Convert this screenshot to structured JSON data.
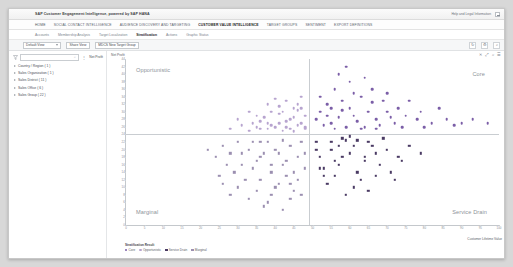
{
  "window": {
    "title": "SAP Customer Engagement Intelligence, powered by SAP HANA",
    "user_label": "Help and Legal Information",
    "logout_icon": "logout-icon"
  },
  "primary_nav": [
    {
      "label": "HOME",
      "active": false
    },
    {
      "label": "SOCIAL CONTACT INTELLIGENCE",
      "active": false
    },
    {
      "label": "AUDIENCE DISCOVERY AND TARGETING",
      "active": false
    },
    {
      "label": "CUSTOMER VALUE INTELLIGENCE",
      "active": true
    },
    {
      "label": "TARGET GROUPS",
      "active": false
    },
    {
      "label": "SENTIMENT",
      "active": false
    },
    {
      "label": "EXPORT DEFINITIONS",
      "active": false
    }
  ],
  "secondary_nav": [
    {
      "label": "Accounts",
      "active": false
    },
    {
      "label": "Membership Analysis",
      "active": false
    },
    {
      "label": "Target Localization",
      "active": false
    },
    {
      "label": "Stratification",
      "active": true
    },
    {
      "label": "Actions",
      "active": false
    },
    {
      "label": "Graphic Status",
      "active": false
    }
  ],
  "filter_bar": {
    "view_select": "Default View",
    "share_button": "Share View",
    "target_group_button": "MDCS New Target Group",
    "refresh_icon": "refresh-icon",
    "settings_icon": "gear-icon",
    "search_icon": "search-icon"
  },
  "sidebar": {
    "funnel_icon": "filter-funnel-icon",
    "search_placeholder": "",
    "search_value": "",
    "search_icon": "search-icon",
    "overflow_icon": "overflow-dots-icon",
    "measure_label": "Net Profit",
    "tree": [
      {
        "label": "Country / Region ( 1 )",
        "expand_icon": "chevron-right-icon"
      },
      {
        "label": "Sales Organization ( 1 )",
        "expand_icon": "chevron-right-icon"
      },
      {
        "label": "Sales District ( 11 )",
        "expand_icon": "chevron-right-icon"
      },
      {
        "label": "Sales Office ( 6 )",
        "expand_icon": "chevron-right-icon"
      },
      {
        "label": "Sales Group ( 22 )",
        "expand_icon": "chevron-right-icon"
      }
    ]
  },
  "chart_toolbar": [
    {
      "glyph": "✕",
      "name": "close-chart-icon"
    },
    {
      "glyph": "⤢",
      "name": "resize-icon"
    },
    {
      "glyph": "⌕",
      "name": "zoom-icon"
    },
    {
      "glyph": "☰",
      "name": "chart-menu-icon"
    }
  ],
  "status_text": "",
  "chart_data": {
    "type": "scatter",
    "title": "Net Profit",
    "xlabel": "Customer Lifetime Value",
    "ylabel": "Net Profit",
    "grid": false,
    "legend_position": "bottom-left",
    "legend_title": "Stratification Result",
    "xlim": [
      0,
      100
    ],
    "ylim": [
      0,
      44
    ],
    "xticks": [
      "0",
      "5",
      "10",
      "15",
      "20",
      "25",
      "30",
      "35",
      "40",
      "45",
      "50",
      "55",
      "60",
      "65",
      "70",
      "75",
      "80",
      "85",
      "90",
      "95",
      "100"
    ],
    "yticks": [
      "44",
      "42",
      "40",
      "38",
      "36",
      "34",
      "32",
      "30",
      "28",
      "26",
      "24",
      "22",
      "20",
      "18",
      "16",
      "14",
      "12",
      "10",
      "8",
      "6",
      "4",
      "2",
      "0"
    ],
    "reference_lines": {
      "x": 49,
      "y": 24
    },
    "quadrants": [
      {
        "key": "tl",
        "label": "Opportunistic"
      },
      {
        "key": "tr",
        "label": "Core"
      },
      {
        "key": "bl",
        "label": "Marginal"
      },
      {
        "key": "br",
        "label": "Service Drain"
      }
    ],
    "legend": [
      {
        "label": "Core",
        "color": "#7b5ea7",
        "shape": "circle"
      },
      {
        "label": "Opportunistic",
        "color": "#b7a4cf",
        "shape": "circle"
      },
      {
        "label": "Service Drain",
        "color": "#4a3a63",
        "shape": "square"
      },
      {
        "label": "Marginal",
        "color": "#9b8fb0",
        "shape": "square"
      }
    ],
    "series": [
      {
        "name": "Opportunistic",
        "color": "#b7a4cf",
        "cls": "opp",
        "points": [
          [
            43,
            33
          ],
          [
            41,
            29.5
          ],
          [
            38,
            27
          ],
          [
            45,
            31
          ],
          [
            40,
            26
          ],
          [
            36,
            25.5
          ],
          [
            47,
            34
          ],
          [
            44,
            28
          ],
          [
            39,
            30
          ],
          [
            46,
            26.5
          ],
          [
            42,
            25
          ],
          [
            37,
            28.5
          ],
          [
            48,
            29
          ],
          [
            35,
            26
          ],
          [
            43,
            27.5
          ],
          [
            46,
            32
          ],
          [
            41,
            31.5
          ],
          [
            44,
            25.5
          ],
          [
            39,
            26.5
          ],
          [
            47,
            27
          ],
          [
            33,
            25
          ],
          [
            45,
            28.5
          ],
          [
            42,
            30
          ],
          [
            38,
            25.5
          ],
          [
            48,
            26
          ],
          [
            31,
            26.5
          ],
          [
            35,
            29
          ],
          [
            40,
            33.5
          ],
          [
            46,
            30.5
          ],
          [
            36,
            27.5
          ],
          [
            28,
            25.5
          ],
          [
            43,
            26
          ],
          [
            48,
            25.5
          ],
          [
            34,
            27
          ],
          [
            41,
            27
          ],
          [
            45,
            24.8
          ],
          [
            30,
            28
          ],
          [
            38,
            32
          ],
          [
            47,
            31
          ],
          [
            33,
            30
          ]
        ]
      },
      {
        "name": "Core",
        "color": "#7b5ea7",
        "cls": "core",
        "points": [
          [
            52,
            30
          ],
          [
            55,
            27
          ],
          [
            58,
            33
          ],
          [
            61,
            29
          ],
          [
            64,
            26
          ],
          [
            56,
            36
          ],
          [
            60,
            31
          ],
          [
            53,
            26.5
          ],
          [
            67,
            28
          ],
          [
            70,
            30
          ],
          [
            63,
            34
          ],
          [
            57,
            28.5
          ],
          [
            72,
            27
          ],
          [
            54,
            32
          ],
          [
            66,
            32.5
          ],
          [
            59,
            26
          ],
          [
            75,
            29
          ],
          [
            62,
            27.5
          ],
          [
            69,
            33
          ],
          [
            51,
            28
          ],
          [
            78,
            28
          ],
          [
            65,
            30
          ],
          [
            73,
            31
          ],
          [
            56,
            25.5
          ],
          [
            60,
            38
          ],
          [
            68,
            26.5
          ],
          [
            82,
            27
          ],
          [
            71,
            28.5
          ],
          [
            58,
            30.5
          ],
          [
            76,
            33
          ],
          [
            63,
            25.5
          ],
          [
            86,
            28
          ],
          [
            79,
            30
          ],
          [
            54,
            29
          ],
          [
            90,
            27
          ],
          [
            66,
            36
          ],
          [
            61,
            35
          ],
          [
            74,
            26
          ],
          [
            93,
            28
          ],
          [
            84,
            31
          ],
          [
            57,
            40
          ],
          [
            52,
            34
          ],
          [
            70,
            35
          ],
          [
            97,
            27
          ],
          [
            88,
            26.5
          ],
          [
            80,
            26
          ],
          [
            64,
            39
          ],
          [
            67,
            25.5
          ],
          [
            55,
            31
          ],
          [
            59,
            42
          ]
        ]
      },
      {
        "name": "Service Drain",
        "color": "#4a3a63",
        "cls": "srv",
        "points": [
          [
            51,
            22
          ],
          [
            55,
            20
          ],
          [
            58,
            18
          ],
          [
            53,
            15
          ],
          [
            61,
            21
          ],
          [
            64,
            17
          ],
          [
            56,
            13
          ],
          [
            59,
            22.5
          ],
          [
            67,
            19
          ],
          [
            52,
            18
          ],
          [
            70,
            20
          ],
          [
            62,
            14
          ],
          [
            57,
            16
          ],
          [
            65,
            22
          ],
          [
            73,
            18
          ],
          [
            54,
            11
          ],
          [
            60,
            19
          ],
          [
            68,
            16
          ],
          [
            76,
            21
          ],
          [
            63,
            12
          ],
          [
            58,
            23
          ],
          [
            71,
            14
          ],
          [
            51,
            20
          ],
          [
            66,
            21
          ],
          [
            79,
            19
          ],
          [
            55,
            22
          ],
          [
            74,
            17
          ],
          [
            61,
            10
          ],
          [
            69,
            23
          ],
          [
            53,
            13
          ],
          [
            59,
            8
          ],
          [
            64,
            18
          ],
          [
            57,
            21
          ],
          [
            72,
            12
          ],
          [
            67,
            13
          ],
          [
            62,
            22.5
          ],
          [
            56,
            17
          ],
          [
            52,
            15
          ],
          [
            60,
            23.5
          ],
          [
            65,
            9
          ]
        ]
      },
      {
        "name": "Marginal",
        "color": "#9b8fb0",
        "cls": "mar",
        "points": [
          [
            38,
            22
          ],
          [
            41,
            19
          ],
          [
            35,
            17
          ],
          [
            44,
            21
          ],
          [
            39,
            14
          ],
          [
            33,
            20
          ],
          [
            46,
            18
          ],
          [
            36,
            12
          ],
          [
            42,
            16
          ],
          [
            30,
            22
          ],
          [
            40,
            10
          ],
          [
            47,
            22
          ],
          [
            37,
            19
          ],
          [
            28,
            19
          ],
          [
            43,
            13
          ],
          [
            34,
            15
          ],
          [
            45,
            9
          ],
          [
            31,
            16
          ],
          [
            39,
            8
          ],
          [
            48,
            15
          ],
          [
            26,
            21
          ],
          [
            41,
            11
          ],
          [
            36,
            22
          ],
          [
            44,
            7
          ],
          [
            32,
            12
          ],
          [
            29,
            14
          ],
          [
            46,
            12
          ],
          [
            38,
            6
          ],
          [
            42,
            22.5
          ],
          [
            24,
            18
          ],
          [
            35,
            9
          ],
          [
            48,
            19
          ],
          [
            30,
            10
          ],
          [
            43,
            17
          ],
          [
            27,
            16
          ],
          [
            40,
            20
          ],
          [
            33,
            7
          ],
          [
            45,
            14
          ],
          [
            37,
            5
          ],
          [
            22,
            20
          ],
          [
            47,
            8
          ],
          [
            31,
            19
          ],
          [
            25,
            13
          ],
          [
            42,
            4
          ],
          [
            36,
            18
          ],
          [
            28,
            8
          ],
          [
            44,
            11
          ],
          [
            34,
            22
          ],
          [
            39,
            16
          ],
          [
            26,
            11
          ]
        ]
      }
    ]
  }
}
